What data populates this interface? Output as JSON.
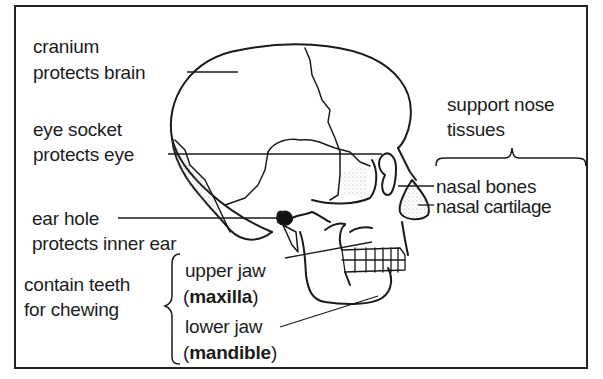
{
  "diagram": {
    "type": "labelled anatomical diagram",
    "labels": {
      "cranium": {
        "name": "cranium",
        "function": "protects brain"
      },
      "eye_socket": {
        "name": "eye socket",
        "function": "protects eye"
      },
      "ear_hole": {
        "name": "ear hole",
        "function": "protects inner ear"
      },
      "nose_group": {
        "function_line1": "support nose",
        "function_line2": "tissues",
        "items": [
          {
            "name": "nasal bones"
          },
          {
            "name": "nasal cartilage"
          }
        ]
      },
      "jaw_group": {
        "function_line1": "contain teeth",
        "function_line2": "for chewing",
        "items": [
          {
            "name": "upper jaw",
            "open": "(",
            "term": "maxilla",
            "close": ")"
          },
          {
            "name": "lower jaw",
            "open": "(",
            "term": "mandible",
            "close": ")"
          }
        ]
      }
    },
    "colors": {
      "line": "#1a1a1a",
      "background": "#ffffff",
      "stipple": "#8a8a8a"
    }
  }
}
